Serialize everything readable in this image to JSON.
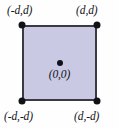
{
  "figure": {
    "kind": "geometry-diagram",
    "canvas": {
      "width": 119,
      "height": 129,
      "background": "#fefefe"
    }
  },
  "colors": {
    "square_fill": "#c9c9e3",
    "square_stroke": "#3a3a44",
    "point_fill": "#111118",
    "label_text": "#111118",
    "background": "#fefefe"
  },
  "shape": {
    "name": "square",
    "fill": "#c9c9e3",
    "stroke": "#3a3a44",
    "stroke_width": 2
  },
  "points": {
    "top_left": {
      "label": "(-d,d)",
      "x": "-d",
      "y": "d"
    },
    "top_right": {
      "label": "(d,d)",
      "x": "d",
      "y": "d"
    },
    "bottom_left": {
      "label": "(-d,-d)",
      "x": "-d",
      "y": "-d"
    },
    "bottom_right": {
      "label": "(d,-d)",
      "x": "d",
      "y": "-d"
    },
    "center": {
      "label": "(0,0)",
      "x": "0",
      "y": "0"
    }
  },
  "markers": {
    "vertex_icon": "filled-circle-point",
    "center_icon": "filled-circle-point"
  }
}
